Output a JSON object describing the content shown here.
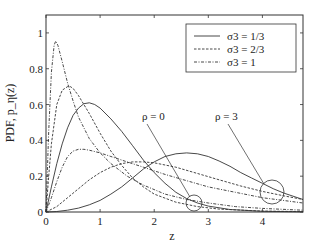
{
  "chart_data": {
    "type": "line",
    "title": "",
    "xlabel": "z",
    "ylabel": "PDF, p_η(z)",
    "xlim": [
      0,
      4.75
    ],
    "ylim": [
      0,
      1.1
    ],
    "xticks": [
      "0",
      "1",
      "2",
      "3",
      "4"
    ],
    "yticks": [
      "0",
      "0.2",
      "0.4",
      "0.6",
      "0.8",
      "1"
    ],
    "grid": false,
    "legend_position": "upper right",
    "legend": [
      {
        "label": "σ3 = 1/3",
        "style": "solid"
      },
      {
        "label": "σ3 = 2/3",
        "style": "dashed"
      },
      {
        "label": "σ3 =  1",
        "style": "dashdot"
      }
    ],
    "annotations": [
      {
        "text": "ρ = 0",
        "target_z": 2.75,
        "target_y": 0.05
      },
      {
        "text": "ρ = 3",
        "target_z": 4.2,
        "target_y": 0.12
      }
    ],
    "series": [
      {
        "name": "σ3 = 1/3, ρ = 0",
        "style": "solid",
        "x": [
          0,
          0.1,
          0.2,
          0.3,
          0.4,
          0.5,
          0.6,
          0.7,
          0.8,
          0.9,
          1.0,
          1.2,
          1.4,
          1.6,
          1.8,
          2.0,
          2.2,
          2.4,
          2.6,
          2.8,
          3.0,
          3.4,
          4.0,
          4.75
        ],
        "y": [
          0,
          0.14,
          0.27,
          0.38,
          0.47,
          0.54,
          0.58,
          0.605,
          0.61,
          0.6,
          0.58,
          0.52,
          0.45,
          0.37,
          0.29,
          0.22,
          0.16,
          0.11,
          0.075,
          0.05,
          0.033,
          0.014,
          0.004,
          0.001
        ]
      },
      {
        "name": "σ3 = 2/3, ρ = 0",
        "style": "dashed",
        "x": [
          0,
          0.05,
          0.1,
          0.2,
          0.3,
          0.4,
          0.45,
          0.5,
          0.6,
          0.8,
          1.0,
          1.2,
          1.4,
          1.6,
          1.8,
          2.0,
          2.4,
          2.8,
          3.2,
          4.0,
          4.75
        ],
        "y": [
          0,
          0.2,
          0.38,
          0.6,
          0.68,
          0.7,
          0.7,
          0.69,
          0.65,
          0.55,
          0.44,
          0.34,
          0.26,
          0.19,
          0.14,
          0.1,
          0.055,
          0.03,
          0.016,
          0.005,
          0.002
        ]
      },
      {
        "name": "σ3 = 1, ρ = 0",
        "style": "dashdot",
        "x": [
          0,
          0.05,
          0.1,
          0.15,
          0.18,
          0.22,
          0.3,
          0.4,
          0.5,
          0.6,
          0.8,
          1.0,
          1.2,
          1.5,
          1.8,
          2.2,
          2.6,
          3.0,
          3.5,
          4.0,
          4.75
        ],
        "y": [
          0,
          0.45,
          0.78,
          0.93,
          0.955,
          0.93,
          0.84,
          0.72,
          0.62,
          0.53,
          0.41,
          0.33,
          0.27,
          0.2,
          0.15,
          0.1,
          0.07,
          0.05,
          0.03,
          0.02,
          0.01
        ]
      },
      {
        "name": "σ3 = 1/3, ρ = 3",
        "style": "solid",
        "x": [
          0,
          0.2,
          0.4,
          0.6,
          0.8,
          1.0,
          1.2,
          1.4,
          1.6,
          1.8,
          2.0,
          2.2,
          2.4,
          2.6,
          2.8,
          3.0,
          3.2,
          3.4,
          3.6,
          3.8,
          4.0,
          4.2,
          4.4,
          4.75
        ],
        "y": [
          0,
          0.003,
          0.01,
          0.022,
          0.04,
          0.065,
          0.1,
          0.14,
          0.19,
          0.24,
          0.28,
          0.31,
          0.325,
          0.33,
          0.325,
          0.31,
          0.285,
          0.255,
          0.22,
          0.19,
          0.16,
          0.13,
          0.105,
          0.07
        ]
      },
      {
        "name": "σ3 = 2/3, ρ = 3",
        "style": "dashed",
        "x": [
          0,
          0.2,
          0.4,
          0.6,
          0.8,
          1.0,
          1.2,
          1.4,
          1.6,
          1.8,
          2.0,
          2.4,
          2.8,
          3.2,
          3.6,
          4.0,
          4.4,
          4.75
        ],
        "y": [
          0,
          0.03,
          0.08,
          0.13,
          0.18,
          0.22,
          0.25,
          0.27,
          0.28,
          0.28,
          0.275,
          0.25,
          0.215,
          0.18,
          0.145,
          0.115,
          0.09,
          0.07
        ]
      },
      {
        "name": "σ3 = 1, ρ = 3",
        "style": "dashdot",
        "x": [
          0,
          0.1,
          0.2,
          0.3,
          0.4,
          0.5,
          0.6,
          0.7,
          0.8,
          1.0,
          1.2,
          1.5,
          1.8,
          2.2,
          2.6,
          3.0,
          3.5,
          4.0,
          4.75
        ],
        "y": [
          0,
          0.08,
          0.17,
          0.25,
          0.31,
          0.34,
          0.35,
          0.35,
          0.345,
          0.33,
          0.31,
          0.28,
          0.25,
          0.21,
          0.175,
          0.14,
          0.11,
          0.08,
          0.05
        ]
      }
    ]
  }
}
